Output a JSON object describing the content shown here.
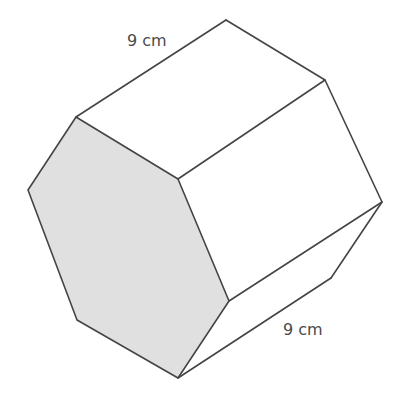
{
  "diagram": {
    "type": "hexagonal-prism",
    "colors": {
      "front_face_fill": "#e0e0e0",
      "edge_stroke": "#444444",
      "label_color": "#4a4a4a",
      "background": "#ffffff"
    },
    "labels": {
      "length_label": "9 cm",
      "side_label": "9 cm"
    },
    "front_hexagon_points": "76,117 178,179 229,301 178,378 77,320 28,190",
    "back_visible_points": {
      "top": [
        226,
        20
      ],
      "upper_right": [
        325,
        80
      ],
      "right": [
        382,
        202
      ],
      "lower_right": [
        331,
        278
      ]
    }
  }
}
